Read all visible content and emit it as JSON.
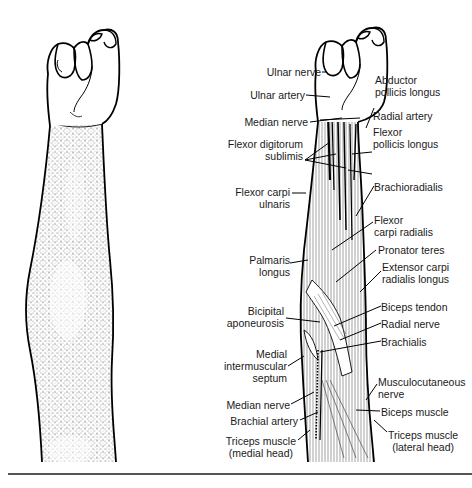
{
  "figure": {
    "panels": [
      {
        "id": "surface",
        "description": "Surface view of right forearm, fist clenched, stippled shading"
      },
      {
        "id": "anatomy",
        "description": "Anatomical view of forearm muscles, nerves and vessels"
      }
    ],
    "labels_left": [
      {
        "text": "Ulnar nerve",
        "x": 321,
        "y": 68
      },
      {
        "text": "Ulnar artery",
        "x": 305,
        "y": 91
      },
      {
        "text": "Median nerve",
        "x": 308,
        "y": 118
      },
      {
        "text": "Flexor digitorum\nsublimis",
        "x": 303,
        "y": 140
      },
      {
        "text": "Flexor carpi\nulnaris",
        "x": 290,
        "y": 188
      },
      {
        "text": "Palmaris\nlongus",
        "x": 290,
        "y": 231
      },
      {
        "text": "Bicipital\naponeurosis",
        "x": 284,
        "y": 306
      },
      {
        "text": "Medial\nintermuscular\nseptum",
        "x": 287,
        "y": 343
      },
      {
        "text": "Median nerve",
        "x": 290,
        "y": 400
      },
      {
        "text": "Brachial artery",
        "x": 298,
        "y": 416
      },
      {
        "text": "Triceps muscle\n(medial head)",
        "x": 296,
        "y": 436
      }
    ],
    "labels_right": [
      {
        "text": "Abductor\npollicis longus",
        "x": 375,
        "y": 76
      },
      {
        "text": "Radial artery",
        "x": 373,
        "y": 112
      },
      {
        "text": "Flexor\npollicis longus",
        "x": 373,
        "y": 132
      },
      {
        "text": "Brachioradialis",
        "x": 374,
        "y": 181
      },
      {
        "text": "Flexor\ncarpi radialis",
        "x": 374,
        "y": 205
      },
      {
        "text": "Pronator teres",
        "x": 378,
        "y": 244
      },
      {
        "text": "Extensor carpi\nradialis longus",
        "x": 382,
        "y": 261
      },
      {
        "text": "Biceps tendon",
        "x": 381,
        "y": 301
      },
      {
        "text": "Radial nerve",
        "x": 381,
        "y": 318
      },
      {
        "text": "Brachialis",
        "x": 381,
        "y": 337
      },
      {
        "text": "Musculocutaneous\nnerve",
        "x": 378,
        "y": 376
      },
      {
        "text": "Biceps muscle",
        "x": 381,
        "y": 407
      },
      {
        "text": "Triceps muscle\n(lateral head)",
        "x": 388,
        "y": 429
      }
    ]
  }
}
